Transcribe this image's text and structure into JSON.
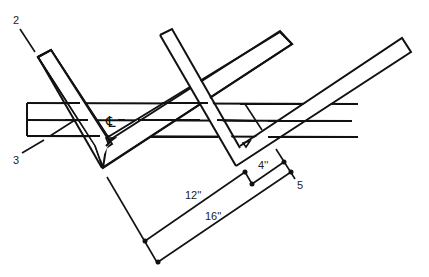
{
  "diagram": {
    "type": "rafter-layout",
    "labels": {
      "callout_2": "2",
      "callout_3": "3",
      "callout_5": "5",
      "centerline": "℄",
      "dim_12": "12''",
      "dim_16": "16''",
      "dim_4": "4''"
    },
    "colors": {
      "line": "#111111",
      "background": "#ffffff"
    }
  }
}
